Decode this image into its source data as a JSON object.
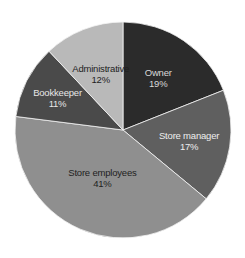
{
  "chart_data": {
    "type": "pie",
    "title": "",
    "start_angle_deg": 0,
    "direction": "clockwise",
    "categories": [
      "Owner",
      "Store manager",
      "Store employees",
      "Bookkeeper",
      "Administrative"
    ],
    "values": [
      19,
      17,
      41,
      11,
      12
    ],
    "value_labels": [
      "19%",
      "17%",
      "41%",
      "11%",
      "12%"
    ],
    "colors": [
      "#2b2b2b",
      "#5f5f5f",
      "#8f8f8f",
      "#4a4a4a",
      "#b9b9b9"
    ],
    "label_colors": [
      "#d8d8d8",
      "#eeeeee",
      "#1e1e1e",
      "#e6e6e6",
      "#1e1e1e"
    ],
    "legend": "none (labels inside slices)",
    "center": [
      123,
      130
    ],
    "radius": 108
  }
}
